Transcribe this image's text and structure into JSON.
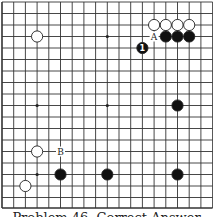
{
  "diagram": {
    "title": "Problem 46. Correct Answer",
    "grid": {
      "x_lines": [
        2,
        13.7,
        25.4,
        37.1,
        48.8,
        60.5,
        72.2,
        83.9,
        95.6,
        107.3,
        119,
        130.7,
        142.4,
        154.1,
        165.8,
        177.5,
        189.2,
        200.9,
        212.6
      ],
      "y_lines": [
        2,
        13.5,
        25,
        36.5,
        48,
        59.5,
        71,
        82.5,
        94,
        105.5,
        117,
        128.5,
        140,
        151.5,
        163,
        174.5,
        186,
        197.5,
        208
      ],
      "bottom_edge": true,
      "left_edge": true,
      "line_color": "#333333"
    },
    "star_points": [
      [
        3,
        3
      ],
      [
        9,
        3
      ],
      [
        3,
        9
      ],
      [
        9,
        9
      ],
      [
        3,
        15
      ]
    ],
    "stones": [
      {
        "color": "white",
        "col": 13,
        "row": 2
      },
      {
        "color": "white",
        "col": 14,
        "row": 2
      },
      {
        "color": "white",
        "col": 15,
        "row": 2
      },
      {
        "color": "white",
        "col": 16,
        "row": 2
      },
      {
        "color": "black",
        "col": 14,
        "row": 3
      },
      {
        "color": "black",
        "col": 15,
        "row": 3
      },
      {
        "color": "black",
        "col": 16,
        "row": 3
      },
      {
        "color": "black",
        "col": 12,
        "row": 4,
        "label": "1"
      },
      {
        "color": "white",
        "col": 3,
        "row": 3
      },
      {
        "color": "black",
        "col": 15,
        "row": 9
      },
      {
        "color": "white",
        "col": 3,
        "row": 13
      },
      {
        "color": "black",
        "col": 5,
        "row": 15
      },
      {
        "color": "black",
        "col": 9,
        "row": 15
      },
      {
        "color": "black",
        "col": 15,
        "row": 15
      },
      {
        "color": "white",
        "col": 2,
        "row": 16
      }
    ],
    "labels": [
      {
        "text": "A",
        "col": 13,
        "row": 3
      },
      {
        "text": "B",
        "col": 5,
        "row": 13
      }
    ]
  }
}
